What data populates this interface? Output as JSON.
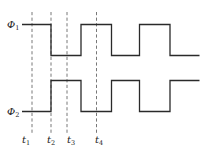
{
  "diagram": {
    "type": "timing-diagram",
    "signals": [
      {
        "name": "Φ1",
        "symbol": "Φ",
        "subscript": "1",
        "high_y": 24.5,
        "low_y": 55.5,
        "points": [
          [
            22,
            24.5
          ],
          [
            51,
            24.5
          ],
          [
            51,
            55.5
          ],
          [
            81,
            55.5
          ],
          [
            81,
            24.5
          ],
          [
            111.5,
            24.5
          ],
          [
            111.5,
            55.5
          ],
          [
            139.5,
            55.5
          ],
          [
            139.5,
            24.5
          ],
          [
            170,
            24.5
          ],
          [
            170,
            55.5
          ],
          [
            199.5,
            55.5
          ]
        ]
      },
      {
        "name": "Φ2",
        "symbol": "Φ",
        "subscript": "2",
        "high_y": 80.5,
        "low_y": 111.5,
        "points": [
          [
            22,
            111.5
          ],
          [
            51,
            111.5
          ],
          [
            51,
            80.5
          ],
          [
            81,
            80.5
          ],
          [
            81,
            111.5
          ],
          [
            111.5,
            111.5
          ],
          [
            111.5,
            80.5
          ],
          [
            139.5,
            80.5
          ],
          [
            139.5,
            111.5
          ],
          [
            170,
            111.5
          ],
          [
            170,
            80.5
          ],
          [
            199.5,
            80.5
          ]
        ]
      }
    ],
    "time_markers": [
      {
        "label": "t",
        "subscript": "1",
        "x": 32
      },
      {
        "label": "t",
        "subscript": "2",
        "x": 51
      },
      {
        "label": "t",
        "subscript": "3",
        "x": 67
      },
      {
        "label": "t",
        "subscript": "4",
        "x": 96.5
      }
    ],
    "colors": {
      "waveform": "#2a2a2a",
      "dashed": "#555555",
      "background": "#ffffff"
    }
  }
}
